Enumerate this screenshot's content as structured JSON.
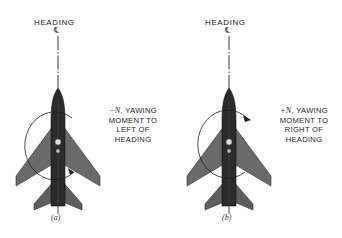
{
  "figure": {
    "panels": [
      {
        "id": "a",
        "heading_label": "HEADING",
        "centerline_symbol": "℄",
        "moment_sign": "−N",
        "moment_text_lines": [
          ", YAWING",
          "MOMENT TO",
          "LEFT OF",
          "HEADING"
        ],
        "sub_label": "(a)",
        "rotation_direction": "counterclockwise"
      },
      {
        "id": "b",
        "heading_label": "HEADING",
        "centerline_symbol": "℄",
        "moment_sign": "+N",
        "moment_text_lines": [
          ", YAWING",
          "MOMENT TO",
          "RIGHT OF",
          "HEADING"
        ],
        "sub_label": "(b)",
        "rotation_direction": "clockwise"
      }
    ]
  },
  "colors": {
    "aircraft_dark": "#2b2b2b",
    "aircraft_wing": "#6a6a6a",
    "line": "#222222",
    "background": "#ffffff"
  }
}
